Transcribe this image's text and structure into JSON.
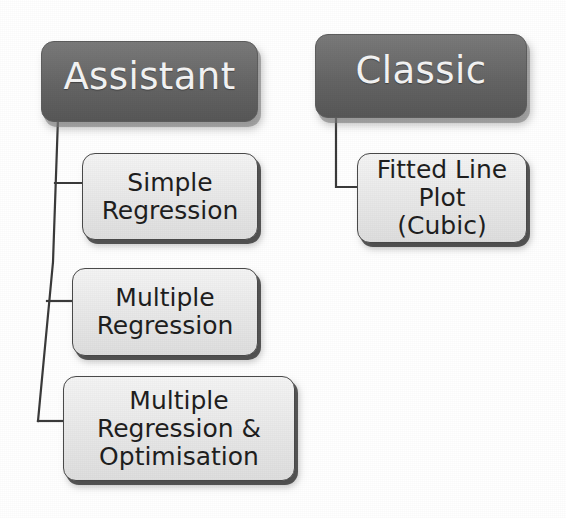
{
  "diagram": {
    "type": "tree",
    "colors": {
      "root_fill": "#6b6b6b",
      "root_text": "#f4f4f4",
      "leaf_fill": "#ececec",
      "leaf_text": "#1f1f1f",
      "leaf_border": "#4a4a4a",
      "connector": "#3a3a3a",
      "background": "#ffffff"
    },
    "branches": [
      {
        "id": "assistant",
        "root": {
          "label": "Assistant",
          "x": 41,
          "y": 41,
          "w": 217,
          "h": 81
        },
        "children": [
          {
            "id": "simple-regression",
            "label": "Simple\nRegression",
            "x": 82,
            "y": 153,
            "w": 176,
            "h": 87
          },
          {
            "id": "multiple-regression",
            "label": "Multiple\nRegression",
            "x": 72,
            "y": 268,
            "w": 186,
            "h": 88
          },
          {
            "id": "multiple-regression-optimisation",
            "label": "Multiple\nRegression &\nOptimisation",
            "x": 63,
            "y": 376,
            "w": 232,
            "h": 105
          }
        ]
      },
      {
        "id": "classic",
        "root": {
          "label": "Classic",
          "x": 315,
          "y": 34,
          "w": 212,
          "h": 84
        },
        "children": [
          {
            "id": "fitted-line-plot-cubic",
            "label": "Fitted Line\nPlot\n(Cubic)",
            "x": 357,
            "y": 153,
            "w": 170,
            "h": 90
          }
        ]
      }
    ],
    "connectors": [
      {
        "id": "assistant-trunk",
        "points": "58,118 52,260 38,420"
      },
      {
        "id": "assistant-branch-1",
        "points": "55,183 82,183"
      },
      {
        "id": "assistant-branch-2",
        "points": "46,300 72,300"
      },
      {
        "id": "assistant-branch-3",
        "points": "38,420 63,420"
      },
      {
        "id": "classic-trunk",
        "points": "336,112 336,187 357,187"
      }
    ]
  }
}
